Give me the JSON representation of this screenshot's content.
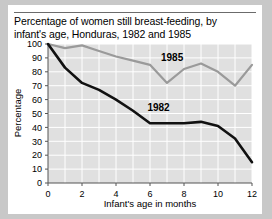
{
  "figure": {
    "title": "Percentage of women still breast-feeding, by infant's age, Honduras, 1982 and 1985",
    "title_line1": "Percentage of women still breast-feeding, by",
    "title_line2": "infant's age, Honduras, 1982 and 1985",
    "background_color": "#c8c8c8",
    "card_color": "#ffffff",
    "plot_fill_color": "#e0e0e0",
    "gridline_color": "#ffffff"
  },
  "chart_data": {
    "type": "line",
    "title": "Percentage of women still breast-feeding, by infant's age, Honduras, 1982 and 1985",
    "xlabel": "Infant's age in months",
    "ylabel": "Percentage",
    "xlim": [
      0,
      12
    ],
    "ylim": [
      0,
      100
    ],
    "xticks": [
      0,
      2,
      4,
      6,
      8,
      10,
      12
    ],
    "xtick_labels": [
      "0",
      "2",
      "4",
      "6",
      "8",
      "10",
      "12"
    ],
    "yticks": [
      0,
      10,
      20,
      30,
      40,
      50,
      60,
      70,
      80,
      90,
      100
    ],
    "ytick_labels": [
      "0",
      "10",
      "20",
      "30",
      "40",
      "50",
      "60",
      "70",
      "80",
      "90",
      "100"
    ],
    "grid": true,
    "legend": "inline-labels",
    "x": [
      0,
      1,
      2,
      3,
      4,
      5,
      6,
      7,
      8,
      9,
      10,
      11,
      12
    ],
    "series": [
      {
        "name": "1985",
        "label": "1985",
        "color": "#9a9a9a",
        "line_width": 2.2,
        "values": [
          100,
          97,
          99,
          95,
          91,
          88,
          85,
          72,
          82,
          86,
          80,
          70,
          85
        ]
      },
      {
        "name": "1982",
        "label": "1982",
        "color": "#111111",
        "line_width": 2.6,
        "values": [
          100,
          83,
          72,
          67,
          60,
          52,
          43,
          43,
          43,
          44,
          41,
          32,
          15
        ]
      }
    ],
    "annotations": [
      {
        "text": "1985",
        "x": 7.3,
        "y": 88,
        "series": "1985"
      },
      {
        "text": "1982",
        "x": 6.5,
        "y": 52,
        "series": "1982"
      }
    ]
  }
}
